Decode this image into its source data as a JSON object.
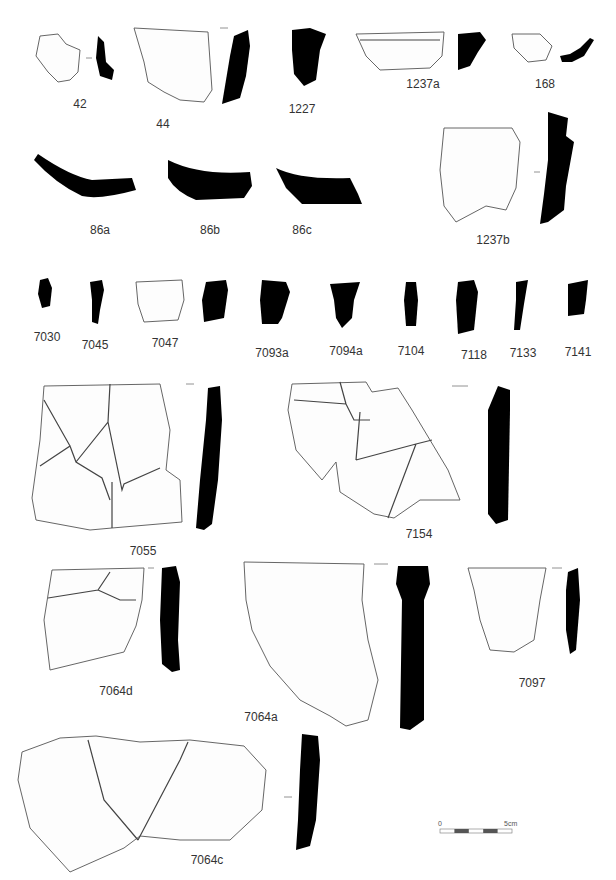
{
  "plate": {
    "title": "Pottery sherds plate",
    "background": "#ffffff",
    "profile_color": "#000000"
  },
  "labels": [
    {
      "id": "42",
      "text": "42",
      "x": 80,
      "y": 97
    },
    {
      "id": "44",
      "text": "44",
      "x": 163,
      "y": 117
    },
    {
      "id": "1227",
      "text": "1227",
      "x": 302,
      "y": 102
    },
    {
      "id": "1237a",
      "text": "1237a",
      "x": 423,
      "y": 77
    },
    {
      "id": "168",
      "text": "168",
      "x": 545,
      "y": 77
    },
    {
      "id": "86a",
      "text": "86a",
      "x": 100,
      "y": 223
    },
    {
      "id": "86b",
      "text": "86b",
      "x": 210,
      "y": 223
    },
    {
      "id": "86c",
      "text": "86c",
      "x": 302,
      "y": 223
    },
    {
      "id": "1237b",
      "text": "1237b",
      "x": 493,
      "y": 233
    },
    {
      "id": "7030",
      "text": "7030",
      "x": 47,
      "y": 330
    },
    {
      "id": "7045",
      "text": "7045",
      "x": 95,
      "y": 338
    },
    {
      "id": "7047",
      "text": "7047",
      "x": 165,
      "y": 336
    },
    {
      "id": "7093a",
      "text": "7093a",
      "x": 272,
      "y": 346
    },
    {
      "id": "7094a",
      "text": "7094a",
      "x": 346,
      "y": 344
    },
    {
      "id": "7104",
      "text": "7104",
      "x": 411,
      "y": 344
    },
    {
      "id": "7118",
      "text": "7118",
      "x": 474,
      "y": 348
    },
    {
      "id": "7133",
      "text": "7133",
      "x": 523,
      "y": 346
    },
    {
      "id": "7141",
      "text": "7141",
      "x": 578,
      "y": 345
    },
    {
      "id": "7055",
      "text": "7055",
      "x": 143,
      "y": 544
    },
    {
      "id": "7154",
      "text": "7154",
      "x": 419,
      "y": 527
    },
    {
      "id": "7064d",
      "text": "7064d",
      "x": 116,
      "y": 684
    },
    {
      "id": "7064a",
      "text": "7064a",
      "x": 261,
      "y": 710
    },
    {
      "id": "7097",
      "text": "7097",
      "x": 532,
      "y": 676
    },
    {
      "id": "7064c",
      "text": "7064c",
      "x": 207,
      "y": 853
    }
  ],
  "scale_bar": {
    "start_label": "0",
    "end_label": "5cm",
    "segments": 5
  }
}
